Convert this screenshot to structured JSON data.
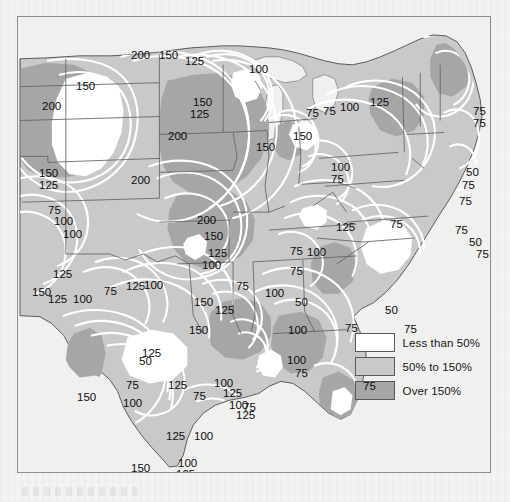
{
  "figure": {
    "type": "contour-choropleth-map",
    "region": "Central and Eastern United States",
    "frame": {
      "x": 17,
      "y": 16,
      "width": 474,
      "height": 457
    }
  },
  "legend": {
    "items": [
      {
        "label": "Less than 50%",
        "color": "#ffffff",
        "swatch_name": "legend-swatch-less-than-50"
      },
      {
        "label": "50% to 150%",
        "color": "#c9c9c9",
        "swatch_name": "legend-swatch-50-to-150"
      },
      {
        "label": "Over 150%",
        "color": "#a6a6a6",
        "swatch_name": "legend-swatch-over-150"
      }
    ]
  },
  "colors": {
    "page_background": "#f3f3f1",
    "map_background": "#f0f0ee",
    "frame_border": "#8d8d8d",
    "band_low": "#ffffff",
    "band_mid": "#c9c9c9",
    "band_high": "#a6a6a6",
    "contour_line": "#ffffff",
    "state_border": "#6a6a6a",
    "coast_line": "#555555",
    "label_text": "#0d0d0d"
  },
  "chart_data": {
    "type": "heatmap",
    "title": "",
    "xlabel": "",
    "ylabel": "",
    "contour_levels": [
      50,
      75,
      100,
      125,
      150,
      200
    ],
    "legend_bands": [
      {
        "name": "Less than 50%",
        "range": [
          0,
          50
        ]
      },
      {
        "name": "50% to 150%",
        "range": [
          50,
          150
        ]
      },
      {
        "name": "Over 150%",
        "range": [
          150,
          300
        ]
      }
    ],
    "contour_labels": [
      {
        "value": "200",
        "x": 113,
        "y": 33
      },
      {
        "value": "150",
        "x": 141,
        "y": 33
      },
      {
        "value": "125",
        "x": 167,
        "y": 39
      },
      {
        "value": "100",
        "x": 231,
        "y": 47
      },
      {
        "value": "100",
        "x": 472,
        "y": 31
      },
      {
        "value": "100",
        "x": 472,
        "y": 44
      },
      {
        "value": "150",
        "x": 58,
        "y": 64
      },
      {
        "value": "200",
        "x": 24,
        "y": 84
      },
      {
        "value": "150",
        "x": 175,
        "y": 80
      },
      {
        "value": "125",
        "x": 172,
        "y": 92
      },
      {
        "value": "75",
        "x": 288,
        "y": 91
      },
      {
        "value": "75",
        "x": 305,
        "y": 89
      },
      {
        "value": "100",
        "x": 322,
        "y": 85
      },
      {
        "value": "125",
        "x": 352,
        "y": 80
      },
      {
        "value": "75",
        "x": 455,
        "y": 89
      },
      {
        "value": "75",
        "x": 455,
        "y": 101
      },
      {
        "value": "200",
        "x": 150,
        "y": 114
      },
      {
        "value": "150",
        "x": 238,
        "y": 125
      },
      {
        "value": "150",
        "x": 275,
        "y": 114
      },
      {
        "value": "100",
        "x": 313,
        "y": 145
      },
      {
        "value": "75",
        "x": 313,
        "y": 157
      },
      {
        "value": "50",
        "x": 448,
        "y": 150
      },
      {
        "value": "75",
        "x": 444,
        "y": 163
      },
      {
        "value": "150",
        "x": 21,
        "y": 151
      },
      {
        "value": "125",
        "x": 21,
        "y": 163
      },
      {
        "value": "200",
        "x": 113,
        "y": 158
      },
      {
        "value": "75",
        "x": 441,
        "y": 179
      },
      {
        "value": "75",
        "x": 30,
        "y": 188
      },
      {
        "value": "100",
        "x": 36,
        "y": 199
      },
      {
        "value": "100",
        "x": 45,
        "y": 212
      },
      {
        "value": "200",
        "x": 179,
        "y": 198
      },
      {
        "value": "150",
        "x": 186,
        "y": 214
      },
      {
        "value": "125",
        "x": 318,
        "y": 205
      },
      {
        "value": "75",
        "x": 372,
        "y": 202
      },
      {
        "value": "75",
        "x": 437,
        "y": 208
      },
      {
        "value": "50",
        "x": 451,
        "y": 220
      },
      {
        "value": "75",
        "x": 458,
        "y": 232
      },
      {
        "value": "125",
        "x": 190,
        "y": 231
      },
      {
        "value": "100",
        "x": 184,
        "y": 243
      },
      {
        "value": "75",
        "x": 272,
        "y": 229
      },
      {
        "value": "100",
        "x": 289,
        "y": 230
      },
      {
        "value": "75",
        "x": 272,
        "y": 249
      },
      {
        "value": "125",
        "x": 35,
        "y": 252
      },
      {
        "value": "150",
        "x": 14,
        "y": 270
      },
      {
        "value": "125",
        "x": 30,
        "y": 277
      },
      {
        "value": "100",
        "x": 55,
        "y": 277
      },
      {
        "value": "75",
        "x": 86,
        "y": 269
      },
      {
        "value": "125",
        "x": 108,
        "y": 264
      },
      {
        "value": "100",
        "x": 126,
        "y": 263
      },
      {
        "value": "75",
        "x": 218,
        "y": 264
      },
      {
        "value": "100",
        "x": 247,
        "y": 271
      },
      {
        "value": "50",
        "x": 277,
        "y": 280
      },
      {
        "value": "50",
        "x": 367,
        "y": 288
      },
      {
        "value": "75",
        "x": 386,
        "y": 307
      },
      {
        "value": "100",
        "x": 270,
        "y": 308
      },
      {
        "value": "75",
        "x": 327,
        "y": 306
      },
      {
        "value": "150",
        "x": 171,
        "y": 308
      },
      {
        "value": "125",
        "x": 124,
        "y": 331
      },
      {
        "value": "50",
        "x": 121,
        "y": 339
      },
      {
        "value": "100",
        "x": 269,
        "y": 338
      },
      {
        "value": "75",
        "x": 277,
        "y": 351
      },
      {
        "value": "150",
        "x": 59,
        "y": 375
      },
      {
        "value": "75",
        "x": 108,
        "y": 363
      },
      {
        "value": "100",
        "x": 105,
        "y": 381
      },
      {
        "value": "125",
        "x": 150,
        "y": 363
      },
      {
        "value": "100",
        "x": 196,
        "y": 361
      },
      {
        "value": "75",
        "x": 175,
        "y": 374
      },
      {
        "value": "125",
        "x": 205,
        "y": 371
      },
      {
        "value": "100",
        "x": 211,
        "y": 383
      },
      {
        "value": "125",
        "x": 218,
        "y": 393
      },
      {
        "value": "75",
        "x": 225,
        "y": 385
      },
      {
        "value": "125",
        "x": 148,
        "y": 414
      },
      {
        "value": "100",
        "x": 176,
        "y": 414
      },
      {
        "value": "150",
        "x": 113,
        "y": 446
      },
      {
        "value": "100",
        "x": 160,
        "y": 441
      },
      {
        "value": "125",
        "x": 158,
        "y": 452
      },
      {
        "value": "75",
        "x": 345,
        "y": 364
      },
      {
        "value": "150",
        "x": 176,
        "y": 280
      },
      {
        "value": "125",
        "x": 197,
        "y": 288
      }
    ]
  }
}
